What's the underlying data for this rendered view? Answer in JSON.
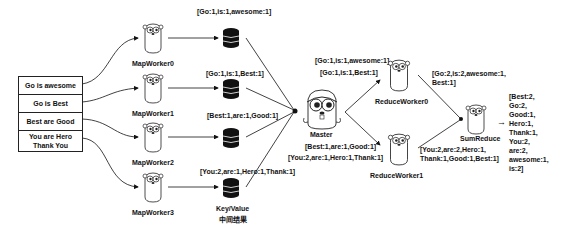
{
  "inputs": {
    "rows": [
      "Go is awesome",
      "Go is Best",
      "Best are Good",
      "You are Hero Thank You"
    ]
  },
  "map_workers": [
    {
      "label": "MapWorker0",
      "output": "[Go:1,is:1,awesome:1]"
    },
    {
      "label": "MapWorker1",
      "output": "[Go:1,is:1,Best:1]"
    },
    {
      "label": "MapWorker2",
      "output": "[Best:1,are:1,Good:1]"
    },
    {
      "label": "MapWorker3",
      "output": "[You:2,are:1,Hero:1,Thank:1]"
    }
  ],
  "storage": {
    "label_line1": "Key/Value",
    "label_line2": "中间结果"
  },
  "master": {
    "label": "Master"
  },
  "reduce_workers": [
    {
      "label": "ReduceWorker0",
      "inputs": [
        "[Go:1,is:1,awesome:1]",
        "[Go:1,is:1,Best:1]"
      ],
      "output_line1": "[Go:2,is:2,awesome:1,",
      "output_line2": "Best:1]"
    },
    {
      "label": "ReduceWorker1",
      "inputs": [
        "[Best:1,are:1,Good:1]",
        "[You:2,are:1,Hero:1,Thank:1]"
      ],
      "output_line1": "[You:2,are:2,Hero:1,",
      "output_line2": "Thank:1,Good:1,Best:1]"
    }
  ],
  "sum_reduce": {
    "label": "SumReduce",
    "arrow": "→",
    "result_lines": [
      "[Best:2,",
      "Go:2,",
      "Good:1,",
      "Hero:1,",
      "Thank:1,",
      "You:2,",
      "are:2,",
      "awesome:1,",
      "is:2]"
    ]
  }
}
